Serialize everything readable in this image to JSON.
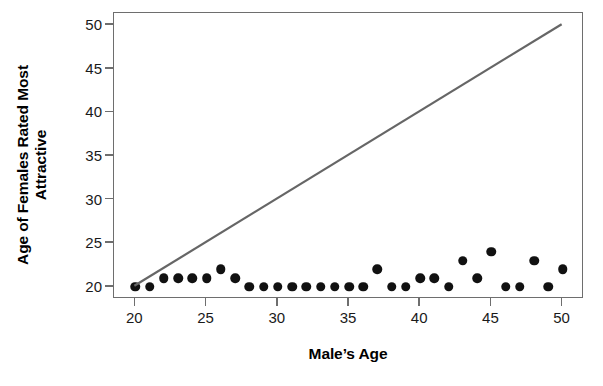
{
  "chart_data": {
    "type": "scatter",
    "title": "",
    "xlabel": "Male’s Age",
    "ylabel_line1": "Age of Females Rated Most",
    "ylabel_line2": "Attractive",
    "xlim": [
      18.5,
      51.5
    ],
    "ylim": [
      18.6,
      51.4
    ],
    "xticks": [
      20,
      25,
      30,
      35,
      40,
      45,
      50
    ],
    "yticks": [
      20,
      25,
      30,
      35,
      40,
      45,
      50
    ],
    "xtick_labels": [
      "20",
      "25",
      "30",
      "35",
      "40",
      "45",
      "50"
    ],
    "ytick_labels": [
      "20",
      "25",
      "30",
      "35",
      "40",
      "45",
      "50"
    ],
    "grid": false,
    "legend": null,
    "marker_color": "#111111",
    "marker_shape": "filled-circle",
    "axis_color": "#6e6e6e",
    "series": [
      {
        "name": "Age of females rated most attractive",
        "x": [
          20,
          21,
          22,
          23,
          24,
          25,
          26,
          27,
          28,
          29,
          30,
          31,
          32,
          33,
          34,
          35,
          36,
          37,
          38,
          39,
          40,
          41,
          42,
          43,
          44,
          45,
          46,
          47,
          48,
          49,
          50
        ],
        "y": [
          20,
          20,
          21,
          21,
          21,
          21,
          22,
          21,
          20,
          20,
          20,
          20,
          20,
          20,
          20,
          20,
          20,
          22,
          20,
          20,
          21,
          21,
          20,
          23,
          21,
          24,
          20,
          20,
          23,
          20,
          22
        ]
      }
    ],
    "reference_line": {
      "name": "line of equality (y = x)",
      "color": "#666666",
      "width": 2.2,
      "x0": 20,
      "y0": 20,
      "x1": 50,
      "y1": 50
    }
  },
  "caption_sliver": ""
}
